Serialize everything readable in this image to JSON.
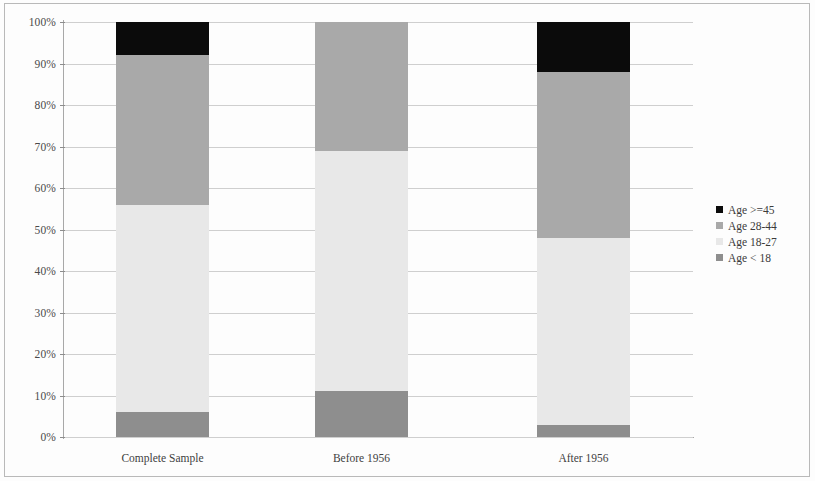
{
  "chart_data": {
    "type": "bar",
    "subtype": "stacked-bar-100-percent",
    "title": "",
    "subtitle": "",
    "xlabel": "",
    "ylabel": "",
    "categories": [
      "Complete Sample",
      "Before 1956",
      "After 1956"
    ],
    "ylim": [
      0,
      100
    ],
    "y_unit": "%",
    "y_tick_labels": [
      "0%",
      "10%",
      "20%",
      "30%",
      "40%",
      "50%",
      "60%",
      "70%",
      "80%",
      "90%",
      "100%"
    ],
    "y_tick_values": [
      0,
      10,
      20,
      30,
      40,
      50,
      60,
      70,
      80,
      90,
      100
    ],
    "grid": true,
    "grid_axis": "y",
    "legend_position": "right",
    "stack_order_bottom_to_top": [
      "Age < 18",
      "Age 18-27",
      "Age 28-44",
      "Age >=45"
    ],
    "series": [
      {
        "name": "Age < 18",
        "color": "#8e8e8e",
        "values": [
          6,
          11,
          3
        ]
      },
      {
        "name": "Age 18-27",
        "color": "#e8e8e8",
        "values": [
          50,
          58,
          45
        ]
      },
      {
        "name": "Age 28-44",
        "color": "#a9a9a9",
        "values": [
          36,
          31,
          40
        ]
      },
      {
        "name": "Age >=45",
        "color": "#0b0b0b",
        "values": [
          8,
          0,
          12
        ]
      }
    ]
  },
  "axes": {
    "y_ticks": [
      {
        "label": "100%",
        "value": 100
      },
      {
        "label": "90%",
        "value": 90
      },
      {
        "label": "80%",
        "value": 80
      },
      {
        "label": "70%",
        "value": 70
      },
      {
        "label": "60%",
        "value": 60
      },
      {
        "label": "50%",
        "value": 50
      },
      {
        "label": "40%",
        "value": 40
      },
      {
        "label": "30%",
        "value": 30
      },
      {
        "label": "20%",
        "value": 20
      },
      {
        "label": "10%",
        "value": 10
      },
      {
        "label": "0%",
        "value": 0
      }
    ],
    "x_ticks": [
      {
        "label": "Complete Sample"
      },
      {
        "label": "Before 1956"
      },
      {
        "label": "After 1956"
      }
    ]
  },
  "legend": {
    "items": [
      {
        "label": "Age >=45",
        "color": "#0b0b0b"
      },
      {
        "label": "Age 28-44",
        "color": "#a9a9a9"
      },
      {
        "label": "Age 18-27",
        "color": "#e8e8e8"
      },
      {
        "label": "Age < 18",
        "color": "#8e8e8e"
      }
    ]
  }
}
